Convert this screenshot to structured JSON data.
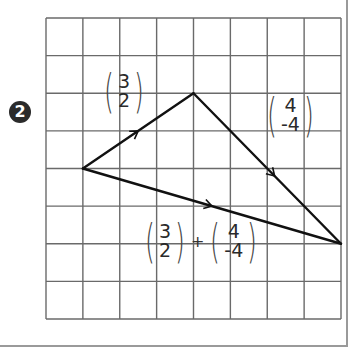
{
  "problem": {
    "number": "2"
  },
  "grid": {
    "cols": 8,
    "rows": 8,
    "x0": 46,
    "y0": 18,
    "x1": 341,
    "y1": 319,
    "line_color": "#6a6a6a"
  },
  "triangle": {
    "stroke": "#111111",
    "vertices": {
      "A": [
        1,
        4
      ],
      "B": [
        4,
        2
      ],
      "C": [
        8,
        6
      ]
    }
  },
  "labels": {
    "vector_ab": {
      "top": "3",
      "bottom": "2"
    },
    "vector_bc": {
      "top": "4",
      "bottom": "-4"
    },
    "sum": {
      "first": {
        "top": "3",
        "bottom": "2"
      },
      "operator": "+",
      "second": {
        "top": "4",
        "bottom": "-4"
      }
    }
  }
}
